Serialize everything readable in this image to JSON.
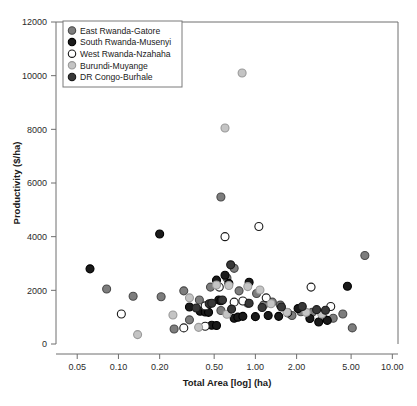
{
  "chart_data": {
    "type": "scatter",
    "title": "",
    "xlabel": "Total Area [log] (ha)",
    "ylabel": "Productivity ($/ha)",
    "xscale": "log",
    "xlim": [
      0.035,
      11.0
    ],
    "ylim": [
      0,
      12000
    ],
    "xticks": [
      0.05,
      0.1,
      0.2,
      0.5,
      1.0,
      2.0,
      5.0,
      10.0
    ],
    "xticklabels": [
      "0.05",
      "0.10",
      "0.20",
      "0.50",
      "1.00",
      "2.00",
      "5.00",
      "10.00"
    ],
    "yticks": [
      0,
      2000,
      4000,
      6000,
      8000,
      10000,
      12000
    ],
    "yticklabels": [
      "0",
      "2000",
      "4000",
      "6000",
      "8000",
      "10000",
      "12000"
    ],
    "grid": false,
    "legend_position": "top-left",
    "series": [
      {
        "name": "East Rwanda-Gatore",
        "marker": "filled-circle",
        "color": "#7d7d7d",
        "edge": "#4a4a4a",
        "points": [
          [
            0.082,
            2050
          ],
          [
            0.128,
            1780
          ],
          [
            0.205,
            1760
          ],
          [
            0.3,
            1980
          ],
          [
            0.39,
            1640
          ],
          [
            0.47,
            2120
          ],
          [
            0.56,
            5480
          ],
          [
            0.56,
            1250
          ],
          [
            0.62,
            2460
          ],
          [
            0.7,
            2820
          ],
          [
            0.76,
            1980
          ],
          [
            0.88,
            1520
          ],
          [
            1.02,
            1880
          ],
          [
            1.15,
            1450
          ],
          [
            1.33,
            1560
          ],
          [
            1.52,
            1450
          ],
          [
            1.85,
            1060
          ],
          [
            2.15,
            1200
          ],
          [
            2.6,
            1180
          ],
          [
            3.1,
            1000
          ],
          [
            3.7,
            960
          ],
          [
            4.35,
            1120
          ],
          [
            5.1,
            600
          ],
          [
            6.3,
            3300
          ],
          [
            0.33,
            900
          ],
          [
            0.255,
            560
          ]
        ]
      },
      {
        "name": "South Rwanda-Musenyi",
        "marker": "filled-circle",
        "color": "#1a1a1a",
        "edge": "#000000",
        "points": [
          [
            0.062,
            2800
          ],
          [
            0.2,
            4100
          ],
          [
            0.33,
            1380
          ],
          [
            0.395,
            1220
          ],
          [
            0.43,
            1190
          ],
          [
            0.455,
            1180
          ],
          [
            0.52,
            2380
          ],
          [
            0.54,
            1640
          ],
          [
            0.56,
            1610
          ],
          [
            0.6,
            2560
          ],
          [
            0.64,
            2260
          ],
          [
            0.7,
            960
          ],
          [
            0.745,
            1000
          ],
          [
            0.81,
            1030
          ],
          [
            0.9,
            2300
          ],
          [
            1.0,
            1020
          ],
          [
            1.24,
            1060
          ],
          [
            1.48,
            1030
          ],
          [
            1.72,
            1160
          ],
          [
            2.05,
            1320
          ],
          [
            2.5,
            950
          ],
          [
            2.9,
            820
          ],
          [
            3.35,
            880
          ],
          [
            4.7,
            2150
          ],
          [
            0.48,
            700
          ],
          [
            0.52,
            690
          ]
        ]
      },
      {
        "name": "West Rwanda-Nzahaha",
        "marker": "open-circle",
        "color": "#ffffff",
        "edge": "#1a1a1a",
        "points": [
          [
            0.105,
            1120
          ],
          [
            0.3,
            600
          ],
          [
            0.43,
            1420
          ],
          [
            0.545,
            2120
          ],
          [
            0.6,
            4000
          ],
          [
            0.7,
            1560
          ],
          [
            0.81,
            1600
          ],
          [
            1.06,
            4380
          ],
          [
            1.2,
            1720
          ],
          [
            2.55,
            2120
          ],
          [
            3.55,
            1400
          ],
          [
            0.43,
            660
          ]
        ]
      },
      {
        "name": "Burundi-Muyange",
        "marker": "filled-circle",
        "color": "#c4c4c4",
        "edge": "#9a9a9a",
        "points": [
          [
            0.138,
            350
          ],
          [
            0.33,
            1720
          ],
          [
            0.385,
            620
          ],
          [
            0.52,
            2200
          ],
          [
            0.6,
            8050
          ],
          [
            0.64,
            2180
          ],
          [
            0.8,
            10100
          ],
          [
            0.88,
            2140
          ],
          [
            1.08,
            2010
          ],
          [
            1.3,
            1500
          ],
          [
            1.7,
            1180
          ],
          [
            2.35,
            1180
          ],
          [
            3.05,
            1120
          ],
          [
            0.25,
            1080
          ],
          [
            0.62,
            1110
          ]
        ]
      },
      {
        "name": "DR Congo-Burhale",
        "marker": "filled-circle",
        "color": "#383838",
        "edge": "#1a1a1a",
        "points": [
          [
            0.37,
            1340
          ],
          [
            0.46,
            1500
          ],
          [
            0.48,
            1520
          ],
          [
            0.575,
            1640
          ],
          [
            0.67,
            1300
          ],
          [
            0.9,
            1520
          ],
          [
            1.12,
            1360
          ],
          [
            1.55,
            1380
          ],
          [
            2.2,
            1400
          ],
          [
            2.8,
            1280
          ],
          [
            3.25,
            1260
          ],
          [
            0.66,
            2950
          ]
        ]
      }
    ]
  }
}
